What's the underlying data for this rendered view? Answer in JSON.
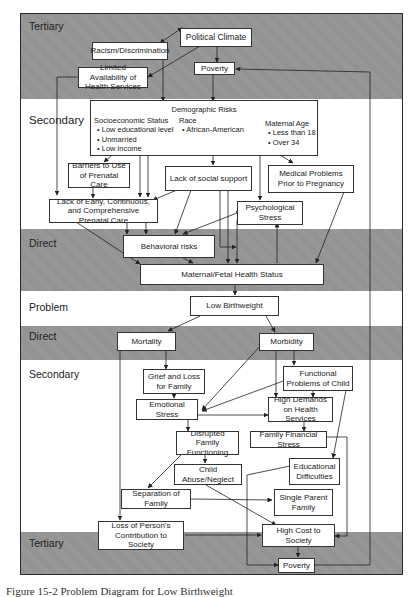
{
  "diagram": {
    "bands": [
      {
        "label": "Tertiary",
        "shade": "gray"
      },
      {
        "label": "Secondary",
        "shade": "white"
      },
      {
        "label": "Direct",
        "shade": "gray"
      },
      {
        "label": "Problem",
        "shade": "white"
      },
      {
        "label": "Direct",
        "shade": "gray"
      },
      {
        "label": "Secondary",
        "shade": "white"
      },
      {
        "label": "Tertiary",
        "shade": "gray"
      }
    ],
    "nodes": {
      "political_climate": "Political Climate",
      "racism": "Racism/Discrimination",
      "poverty_top": "Poverty",
      "limited_availability": "Limited Availability of Health Services",
      "demographic": {
        "title": "Demographic Risks",
        "ses": {
          "heading": "Socioeconomic Status",
          "items": [
            "Low educational level",
            "Unmarried",
            "Low income"
          ]
        },
        "race": {
          "heading": "Race",
          "items": [
            "African-American"
          ]
        },
        "age": {
          "heading": "Maternal Age",
          "items": [
            "Less than 18",
            "Over 34"
          ]
        }
      },
      "barriers": "Barriers to Use of Prenatal Care",
      "lack_social_support": "Lack of social support",
      "medical_problems": "Medical Problems Prior to Pregnancy",
      "lack_prenatal_care": "Lack of Early, Continuous, and Comprehensive Prenatal Care",
      "psychological_stress": "Psychological Stress",
      "behavioral_risks": "Behavioral risks",
      "maternal_fetal": "Maternal/Fetal Health Status",
      "low_birthweight": "Low Birthweight",
      "mortality": "Mortality",
      "morbidity": "Morbidity",
      "grief_loss": "Grief and Loss for Family",
      "functional_problems": "Functional Problems of Child",
      "emotional_stress": "Emotional Stress",
      "high_demands": "High Demands on Health Services",
      "disrupted_family": "Disrupted Family Functioning",
      "family_financial": "Family Financial Stress",
      "child_abuse": "Child Abuse/Neglect",
      "educational_difficulties": "Educational Difficulties",
      "separation_family": "Separation of Family",
      "single_parent": "Single Parent Family",
      "loss_contribution": "Loss of Person's Contribution to Society",
      "high_cost": "High Cost to Society",
      "poverty_bottom": "Poverty"
    }
  },
  "caption": "Figure 15-2 Problem Diagram for Low Birthweight"
}
